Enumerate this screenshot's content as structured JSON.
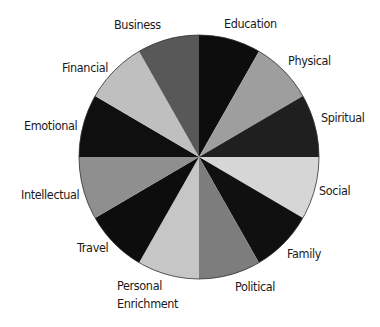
{
  "chart_data": {
    "type": "pie",
    "title": "",
    "start_angle_deg": 0,
    "direction": "clockwise",
    "categories": [
      "Education",
      "Physical",
      "Spiritual",
      "Social",
      "Family",
      "Political",
      "Personal Enrichment",
      "Travel",
      "Intellectual",
      "Emotional",
      "Financial",
      "Business"
    ],
    "values": [
      1,
      1,
      1,
      1,
      1,
      1,
      1,
      1,
      1,
      1,
      1,
      1
    ],
    "colors": [
      "#0d0d0d",
      "#9e9e9e",
      "#1f1f1f",
      "#d6d6d6",
      "#101010",
      "#7d7d7d",
      "#c6c6c6",
      "#0d0d0d",
      "#8f8f8f",
      "#0f0f0f",
      "#bfbfbf",
      "#585858"
    ],
    "legend": "none (labels placed around the pie)",
    "center": [
      199,
      157
    ],
    "radius": [
      120,
      122
    ]
  },
  "labels": [
    {
      "key": "education",
      "text": "Education",
      "x": 224,
      "y": 15
    },
    {
      "key": "physical",
      "text": "Physical",
      "x": 288,
      "y": 52
    },
    {
      "key": "spiritual",
      "text": "Spiritual",
      "x": 321,
      "y": 109
    },
    {
      "key": "social",
      "text": "Social",
      "x": 319,
      "y": 182
    },
    {
      "key": "family",
      "text": "Family",
      "x": 287,
      "y": 245
    },
    {
      "key": "political",
      "text": "Political",
      "x": 235,
      "y": 278
    },
    {
      "key": "personal-enrichment-line1",
      "text": "Personal",
      "x": 117,
      "y": 277
    },
    {
      "key": "personal-enrichment-line2",
      "text": "Enrichment",
      "x": 117,
      "y": 295
    },
    {
      "key": "travel",
      "text": "Travel",
      "x": 77,
      "y": 239
    },
    {
      "key": "intellectual",
      "text": "Intellectual",
      "x": 21,
      "y": 186
    },
    {
      "key": "emotional",
      "text": "Emotional",
      "x": 24,
      "y": 117
    },
    {
      "key": "financial",
      "text": "Financial",
      "x": 62,
      "y": 59
    },
    {
      "key": "business",
      "text": "Business",
      "x": 114,
      "y": 16
    }
  ]
}
